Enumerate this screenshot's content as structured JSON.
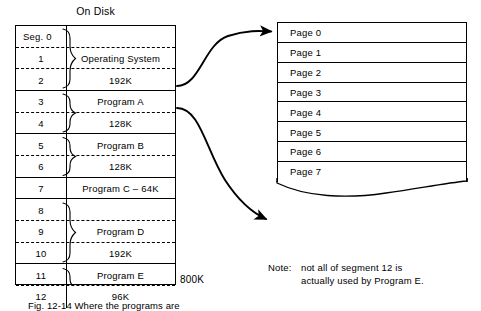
{
  "figure": {
    "disk_title": "On Disk",
    "capacity_label": "800K",
    "caption": "Fig. 12-14  Where the programs are",
    "note": {
      "label": "Note:",
      "line1": "not all of segment 12 is",
      "line2": "actually used by Program E."
    }
  },
  "disk_table": {
    "rows": [
      {
        "num": "Seg. 0",
        "desc": "",
        "sep": "dash",
        "num_align": "left"
      },
      {
        "num": "1",
        "desc": "Operating System",
        "sep": "dash",
        "num_align": "center"
      },
      {
        "num": "2",
        "desc": "192K",
        "sep": "solid",
        "num_align": "center"
      },
      {
        "num": "3",
        "desc": "Program A",
        "sep": "dash",
        "num_align": "center"
      },
      {
        "num": "4",
        "desc": "128K",
        "sep": "solid",
        "num_align": "center"
      },
      {
        "num": "5",
        "desc": "Program B",
        "sep": "dash",
        "num_align": "center"
      },
      {
        "num": "6",
        "desc": "128K",
        "sep": "solid",
        "num_align": "center"
      },
      {
        "num": "7",
        "desc": "Program C – 64K",
        "sep": "solid",
        "num_align": "center"
      },
      {
        "num": "8",
        "desc": "",
        "sep": "dash",
        "num_align": "center"
      },
      {
        "num": "9",
        "desc": "Program D",
        "sep": "dash",
        "num_align": "center"
      },
      {
        "num": "10",
        "desc": "192K",
        "sep": "solid",
        "num_align": "center"
      },
      {
        "num": "11",
        "desc": "Program E",
        "sep": "dash",
        "num_align": "center"
      },
      {
        "num": "12",
        "desc": "96K",
        "sep": "none",
        "num_align": "center"
      }
    ],
    "groups": [
      {
        "name": "operating-system",
        "first_row": 0,
        "last_row": 2
      },
      {
        "name": "program-a",
        "first_row": 3,
        "last_row": 4
      },
      {
        "name": "program-b",
        "first_row": 5,
        "last_row": 6
      },
      {
        "name": "program-d",
        "first_row": 8,
        "last_row": 10
      },
      {
        "name": "program-e",
        "first_row": 11,
        "last_row": 12
      }
    ]
  },
  "page_table": {
    "rows": [
      {
        "label": "Page 0"
      },
      {
        "label": "Page 1"
      },
      {
        "label": "Page 2"
      },
      {
        "label": "Page 3"
      },
      {
        "label": "Page 4"
      },
      {
        "label": "Page 5"
      },
      {
        "label": "Page 6"
      },
      {
        "label": "Page 7"
      }
    ]
  },
  "colors": {
    "ink": "#000000",
    "paper": "#ffffff"
  }
}
